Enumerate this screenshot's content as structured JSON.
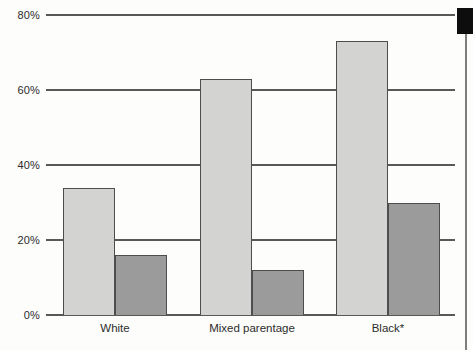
{
  "figure": {
    "background": "#fdfdfc",
    "page_tab_color": "#0d0d0d",
    "page_edge_color": "#7d7d7d"
  },
  "chart_data": {
    "type": "bar",
    "title": "",
    "xlabel": "",
    "ylabel": "",
    "categories": [
      "White",
      "Mixed parentage",
      "Black*"
    ],
    "series": [
      {
        "name": "light",
        "color": "#d3d3d2",
        "values": [
          34,
          63,
          73
        ]
      },
      {
        "name": "dark",
        "color": "#9b9b9b",
        "values": [
          16,
          12,
          30
        ]
      }
    ],
    "ylim": [
      0,
      80
    ],
    "ytick_values": [
      0,
      20,
      40,
      60,
      80
    ],
    "ytick_labels": [
      "0%",
      "20%",
      "40%",
      "60%",
      "80%"
    ],
    "grid": true,
    "legend": "none",
    "gridline_color": "#585858",
    "bar_border_color": "#4d4d4d",
    "text_color": "#2b2b2b"
  }
}
